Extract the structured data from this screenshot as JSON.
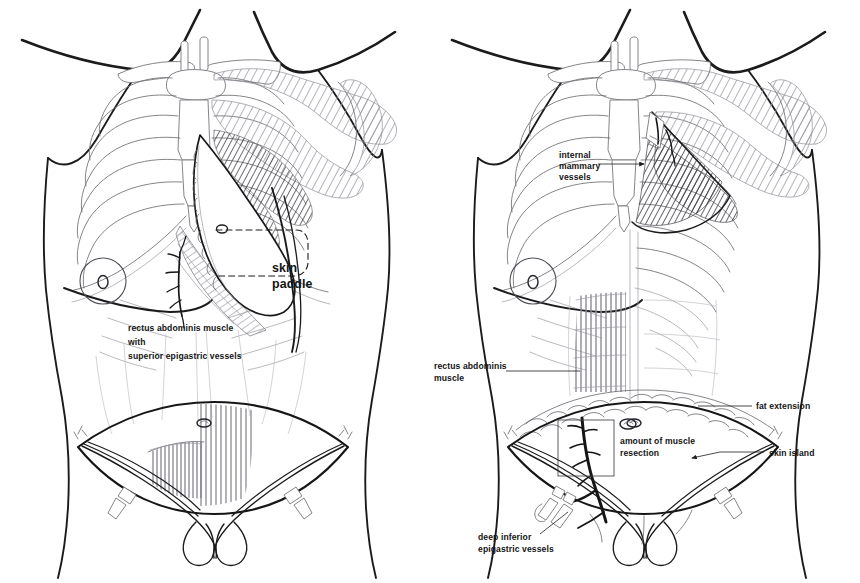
{
  "figure": {
    "background_color": "#ffffff",
    "ink_color": "#1a1a1a",
    "width": 860,
    "height": 583
  },
  "panels": [
    {
      "id": "left-panel",
      "name": "pedicled-tram-flap",
      "labels": [
        {
          "id": "skin-paddle",
          "lines": [
            "skin",
            "paddle"
          ],
          "size": "large",
          "x": 272,
          "y": 272,
          "leader": "none"
        },
        {
          "id": "rectus-superior",
          "lines": [
            "rectus abdominis muscle",
            "with",
            "superior epigastric vessels"
          ],
          "size": "small",
          "x": 128,
          "y": 331,
          "leader": "none"
        }
      ],
      "anatomy": [
        "clavicles",
        "sternum",
        "manubrium",
        "ribs",
        "costal-margin",
        "pectoralis-major-shaded",
        "breast-areola",
        "rectus-abdominis-muscle",
        "superior-epigastric-vessels",
        "skin-paddle-teardrop",
        "dashed-breast-pocket",
        "lower-abdominal-skin-ellipse",
        "umbilicus",
        "inguinal-ligaments",
        "femoral-vessels"
      ]
    },
    {
      "id": "right-panel",
      "name": "free-tram-flap",
      "labels": [
        {
          "id": "internal-mammary-vessels",
          "lines": [
            "internal",
            "mammary",
            "vessels"
          ],
          "size": "small",
          "x": 559,
          "y": 158,
          "leader": "arrow-right"
        },
        {
          "id": "rectus-abdominis-muscle",
          "lines": [
            "rectus abdominis",
            "muscle"
          ],
          "size": "small",
          "x": 434,
          "y": 369,
          "leader": "line-right"
        },
        {
          "id": "fat-extension",
          "lines": [
            "fat extension"
          ],
          "size": "small",
          "x": 756,
          "y": 409,
          "leader": "line-left"
        },
        {
          "id": "skin-island",
          "lines": [
            "skin island"
          ],
          "size": "small",
          "x": 769,
          "y": 456,
          "leader": "line-left-arrow"
        },
        {
          "id": "amount-of-muscle-resection",
          "lines": [
            "amount of muscle",
            "resection"
          ],
          "size": "small",
          "x": 620,
          "y": 444,
          "leader": "box"
        },
        {
          "id": "deep-inferior-epigastric-vessels",
          "lines": [
            "deep inferior",
            "epigastric vessels"
          ],
          "size": "small",
          "x": 508,
          "y": 540,
          "leader": "line-up"
        }
      ],
      "anatomy": [
        "clavicles",
        "sternum",
        "ribs",
        "costal-margin",
        "pectoralis-major-divided-shaded",
        "internal-mammary-vessels-clipped",
        "breast-areola",
        "rectus-abdominis-striations",
        "deep-inferior-epigastric-vessels",
        "vascular-clips",
        "fat-extension-scalloped-band",
        "lower-abdominal-skin-island-ellipse",
        "muscle-resection-box",
        "umbilicus",
        "inguinal-ligaments"
      ]
    }
  ]
}
